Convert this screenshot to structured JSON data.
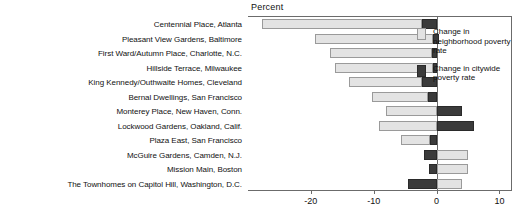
{
  "chart_data": {
    "type": "bar",
    "orientation": "horizontal",
    "title": "",
    "xlabel": "Percent",
    "ylabel": "",
    "xlim": [
      -30,
      12
    ],
    "xticks": [
      -20,
      -10,
      0,
      10
    ],
    "xtick_labels": [
      "-20",
      "-10",
      "0",
      "10"
    ],
    "grid": false,
    "legend_position": "right",
    "categories": [
      "Centennial Place, Atlanta",
      "Pleasant View Gardens, Baltimore",
      "First Ward/Autumn Place, Charlotte, N.C.",
      "Hillside Terrace, Milwaukee",
      "King Kennedy/Outhwaite Homes, Cleveland",
      "Bernal Dwellings, San Francisco",
      "Monterey Place, New Haven, Conn.",
      "Lockwood Gardens, Oakland, Calif.",
      "Plaza East, San Francisco",
      "McGuire Gardens, Camden, N.J.",
      "Mission Main, Boston",
      "The Townhomes on Capitol Hill, Washington, D.C."
    ],
    "series": [
      {
        "name": "Change in neighborhood poverty rate",
        "color": "#e3e3e3",
        "values": [
          -27.8,
          -19.3,
          -17.0,
          -16.1,
          -14.0,
          -10.3,
          -8.0,
          -9.2,
          -5.6,
          5.0,
          5.0,
          4.0
        ]
      },
      {
        "name": "Change in citywide poverty rate",
        "color": "#3b3b3b",
        "values": [
          -2.3,
          -0.6,
          -0.7,
          -0.6,
          -2.3,
          -1.3,
          4.0,
          6.0,
          -1.0,
          -2.0,
          -1.2,
          -4.5
        ]
      }
    ],
    "bar_segments": [
      {
        "row": 0,
        "series": 0,
        "from": -27.8,
        "to": -2.3
      },
      {
        "row": 0,
        "series": 1,
        "from": -2.3,
        "to": 0
      },
      {
        "row": 1,
        "series": 0,
        "from": -19.3,
        "to": -0.6
      },
      {
        "row": 1,
        "series": 1,
        "from": -0.6,
        "to": 0.4
      },
      {
        "row": 2,
        "series": 0,
        "from": -17.0,
        "to": -0.7
      },
      {
        "row": 2,
        "series": 1,
        "from": -0.7,
        "to": 0
      },
      {
        "row": 3,
        "series": 0,
        "from": -16.1,
        "to": -0.6
      },
      {
        "row": 3,
        "series": 1,
        "from": -0.6,
        "to": 0
      },
      {
        "row": 4,
        "series": 0,
        "from": -14.0,
        "to": -2.3
      },
      {
        "row": 4,
        "series": 1,
        "from": -2.3,
        "to": 0
      },
      {
        "row": 5,
        "series": 0,
        "from": -10.3,
        "to": -1.3
      },
      {
        "row": 5,
        "series": 1,
        "from": -1.3,
        "to": 0
      },
      {
        "row": 6,
        "series": 0,
        "from": -8.0,
        "to": 0
      },
      {
        "row": 6,
        "series": 1,
        "from": 0,
        "to": 4.0
      },
      {
        "row": 7,
        "series": 0,
        "from": -9.2,
        "to": 0
      },
      {
        "row": 7,
        "series": 1,
        "from": 0,
        "to": 6.0
      },
      {
        "row": 8,
        "series": 0,
        "from": -5.6,
        "to": -1.0
      },
      {
        "row": 8,
        "series": 1,
        "from": -1.0,
        "to": 0
      },
      {
        "row": 9,
        "series": 1,
        "from": -2.0,
        "to": 0
      },
      {
        "row": 9,
        "series": 0,
        "from": 0,
        "to": 5.0
      },
      {
        "row": 10,
        "series": 1,
        "from": -1.2,
        "to": 0
      },
      {
        "row": 10,
        "series": 0,
        "from": 0,
        "to": 5.0
      },
      {
        "row": 11,
        "series": 1,
        "from": -4.5,
        "to": 0
      },
      {
        "row": 11,
        "series": 0,
        "from": 0,
        "to": 4.0
      }
    ]
  },
  "legend": {
    "entries": [
      {
        "label": "Change in neighborhood poverty rate",
        "swatch": "light"
      },
      {
        "label": "Change in citywide poverty rate",
        "swatch": "dark"
      }
    ]
  }
}
